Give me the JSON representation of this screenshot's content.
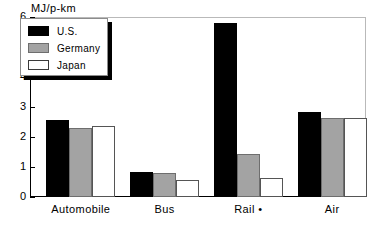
{
  "chart_data": {
    "type": "bar",
    "title": "",
    "subtitle": "",
    "xlabel": "",
    "ylabel": "MJ/p-km",
    "ylim": [
      0,
      6
    ],
    "yticks": [
      0,
      1,
      2,
      3,
      4,
      5,
      6
    ],
    "ytick_labels": [
      "0",
      "1",
      "2",
      "3",
      "4",
      "5",
      "6"
    ],
    "grid": false,
    "legend_position": "top-left",
    "categories": [
      "Automobile",
      "Bus",
      "Rail •",
      "Air"
    ],
    "series": [
      {
        "name": "U.S.",
        "color": "#000000",
        "values": [
          2.58,
          0.84,
          5.79,
          2.84
        ]
      },
      {
        "name": "Germany",
        "color": "#a3a3a3",
        "values": [
          2.31,
          0.8,
          1.43,
          2.64
        ]
      },
      {
        "name": "Japan",
        "color": "#ffffff",
        "values": [
          2.38,
          0.58,
          0.63,
          2.63
        ]
      }
    ],
    "annotations": [
      "• footnote marker on Rail category"
    ]
  },
  "legend": {
    "items": [
      {
        "label": "U.S.",
        "swatch": "black-filled-swatch"
      },
      {
        "label": "Germany",
        "swatch": "gray-filled-swatch"
      },
      {
        "label": "Japan",
        "swatch": "white-filled-swatch"
      }
    ]
  },
  "colors": {
    "us": "#000000",
    "germany": "#a3a3a3",
    "japan": "#ffffff",
    "axis": "#000000",
    "frame": "#b9b9b9",
    "background": "#ffffff"
  }
}
